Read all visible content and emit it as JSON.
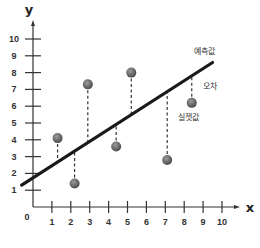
{
  "chart_data": {
    "type": "scatter",
    "title": "",
    "xlabel": "x",
    "ylabel": "y",
    "xlim": [
      0,
      10
    ],
    "ylim": [
      0,
      10
    ],
    "grid": false,
    "x_ticks": [
      "1",
      "2",
      "3",
      "4",
      "5",
      "6",
      "7",
      "8",
      "9",
      "10"
    ],
    "y_ticks": [
      "1",
      "2",
      "3",
      "4",
      "5",
      "6",
      "7",
      "8",
      "9",
      "10"
    ],
    "origin_label": "0",
    "series": [
      {
        "name": "실젯값",
        "type": "scatter",
        "points": [
          {
            "x": 1.3,
            "y": 4.1
          },
          {
            "x": 2.2,
            "y": 1.4
          },
          {
            "x": 2.9,
            "y": 7.3
          },
          {
            "x": 4.4,
            "y": 3.6
          },
          {
            "x": 5.2,
            "y": 8.0
          },
          {
            "x": 7.1,
            "y": 2.8
          },
          {
            "x": 8.4,
            "y": 6.2
          }
        ]
      },
      {
        "name": "예측값",
        "type": "line",
        "points": [
          {
            "x": -0.6,
            "y": 1.3
          },
          {
            "x": 9.5,
            "y": 8.6
          }
        ]
      }
    ],
    "annotations": [
      {
        "text": "예측값",
        "x": 9.0,
        "y": 8.9
      },
      {
        "text": "오차",
        "x": 9.4,
        "y": 7.2
      },
      {
        "text": "실젯값",
        "x": 8.4,
        "y": 5.4
      }
    ],
    "residual_lines": "dashed vertical lines from each actual point to the regression line"
  },
  "labels": {
    "x_axis": "x",
    "y_axis": "y",
    "origin": "0",
    "predicted": "예측값",
    "error": "오차",
    "actual": "실젯값"
  },
  "colors": {
    "axis": "#333333",
    "line": "#1a1a1a",
    "point": "#6b6b6b",
    "residual": "#333333"
  }
}
